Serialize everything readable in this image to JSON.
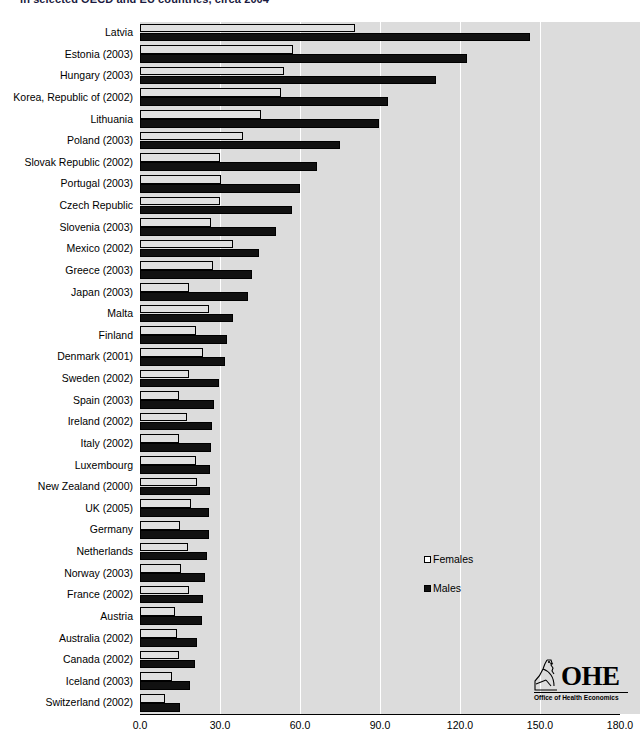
{
  "chart_data": {
    "type": "bar",
    "orientation": "horizontal",
    "title": "in selected OECD and EU countries, circa 2004",
    "xlabel": "",
    "ylabel": "",
    "xlim": [
      0.0,
      180.0
    ],
    "xticks": [
      "0.0",
      "30.0",
      "60.0",
      "90.0",
      "120.0",
      "150.0",
      "180.0"
    ],
    "grid": true,
    "legend_position": "center-right",
    "categories": [
      "Latvia",
      "Estonia (2003)",
      "Hungary (2003)",
      "Korea, Republic of (2002)",
      "Lithuania",
      "Poland (2003)",
      "Slovak Republic (2002)",
      "Portugal (2003)",
      "Czech Republic",
      "Slovenia (2003)",
      "Mexico (2002)",
      "Greece (2003)",
      "Japan (2003)",
      "Malta",
      "Finland",
      "Denmark (2001)",
      "Sweden (2002)",
      "Spain (2003)",
      "Ireland (2002)",
      "Italy (2002)",
      "Luxembourg",
      "New Zealand (2000)",
      "UK (2005)",
      "Germany",
      "Netherlands",
      "Norway (2003)",
      "France (2002)",
      "Austria",
      "Australia (2002)",
      "Canada (2002)",
      "Iceland (2003)",
      "Switzerland (2002)"
    ],
    "series": [
      {
        "name": "Females",
        "color": "#e0e0e0",
        "values": [
          80.6,
          57.4,
          54.0,
          52.9,
          45.4,
          38.6,
          30.0,
          30.4,
          30.0,
          26.6,
          34.9,
          27.4,
          18.4,
          25.9,
          21.0,
          23.6,
          18.4,
          14.6,
          17.6,
          14.6,
          21.0,
          21.4,
          19.1,
          15.0,
          18.0,
          15.4,
          18.4,
          13.1,
          13.9,
          14.6,
          12.0,
          9.4
        ]
      },
      {
        "name": "Males",
        "color": "#111111",
        "values": [
          146.3,
          122.6,
          111.0,
          93.0,
          89.6,
          75.0,
          66.4,
          60.0,
          57.0,
          51.0,
          44.6,
          42.0,
          40.5,
          34.9,
          32.6,
          31.9,
          29.6,
          27.8,
          27.0,
          26.6,
          26.3,
          26.3,
          25.9,
          25.9,
          25.1,
          24.4,
          23.6,
          23.3,
          21.4,
          20.6,
          18.8,
          15.0
        ]
      }
    ]
  },
  "legend": {
    "females_label": "Females",
    "males_label": "Males"
  },
  "logo": {
    "acronym": "OHE",
    "subtitle": "Office of Health Economics"
  }
}
